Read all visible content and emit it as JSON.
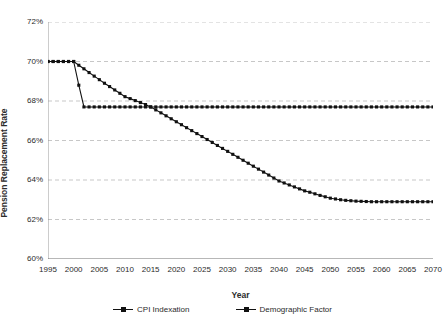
{
  "chart_data": {
    "type": "line",
    "title": "",
    "xlabel": "Year",
    "ylabel": "Pension Replacement Rate",
    "xlim": [
      1995,
      2070
    ],
    "ylim": [
      60,
      72
    ],
    "ytick_step": 2,
    "xtick_step": 5,
    "grid": true,
    "grid_style": "dashed-horizontal",
    "legend_position": "bottom",
    "ytick_labels": [
      "60%",
      "62%",
      "64%",
      "66%",
      "68%",
      "70%",
      "72%"
    ],
    "ytick_values": [
      60,
      62,
      64,
      66,
      68,
      70,
      72
    ],
    "xtick_labels": [
      "1995",
      "2000",
      "2005",
      "2010",
      "2015",
      "2020",
      "2025",
      "2030",
      "2035",
      "2040",
      "2045",
      "2050",
      "2055",
      "2060",
      "2065",
      "2070"
    ],
    "xtick_values": [
      1995,
      2000,
      2005,
      2010,
      2015,
      2020,
      2025,
      2030,
      2035,
      2040,
      2045,
      2050,
      2055,
      2060,
      2065,
      2070
    ],
    "x": [
      1995,
      1996,
      1997,
      1998,
      1999,
      2000,
      2001,
      2002,
      2003,
      2004,
      2005,
      2006,
      2007,
      2008,
      2009,
      2010,
      2011,
      2012,
      2013,
      2014,
      2015,
      2016,
      2017,
      2018,
      2019,
      2020,
      2021,
      2022,
      2023,
      2024,
      2025,
      2026,
      2027,
      2028,
      2029,
      2030,
      2031,
      2032,
      2033,
      2034,
      2035,
      2036,
      2037,
      2038,
      2039,
      2040,
      2041,
      2042,
      2043,
      2044,
      2045,
      2046,
      2047,
      2048,
      2049,
      2050,
      2051,
      2052,
      2053,
      2054,
      2055,
      2056,
      2057,
      2058,
      2059,
      2060,
      2061,
      2062,
      2063,
      2064,
      2065,
      2066,
      2067,
      2068,
      2069,
      2070
    ],
    "series": [
      {
        "name": "CPI Indexation",
        "color": "#111111",
        "marker": "square",
        "values": [
          70.0,
          70.0,
          70.0,
          70.0,
          70.0,
          70.0,
          68.8,
          67.7,
          67.7,
          67.7,
          67.7,
          67.7,
          67.7,
          67.7,
          67.7,
          67.7,
          67.7,
          67.7,
          67.7,
          67.7,
          67.7,
          67.7,
          67.7,
          67.7,
          67.7,
          67.7,
          67.7,
          67.7,
          67.7,
          67.7,
          67.7,
          67.7,
          67.7,
          67.7,
          67.7,
          67.7,
          67.7,
          67.7,
          67.7,
          67.7,
          67.7,
          67.7,
          67.7,
          67.7,
          67.7,
          67.7,
          67.7,
          67.7,
          67.7,
          67.7,
          67.7,
          67.7,
          67.7,
          67.7,
          67.7,
          67.7,
          67.7,
          67.7,
          67.7,
          67.7,
          67.7,
          67.7,
          67.7,
          67.7,
          67.7,
          67.7,
          67.7,
          67.7,
          67.7,
          67.7,
          67.7,
          67.7,
          67.7,
          67.7,
          67.7,
          67.7
        ]
      },
      {
        "name": "Demographic Factor",
        "color": "#111111",
        "marker": "square",
        "values": [
          70.0,
          70.0,
          70.0,
          70.0,
          70.0,
          70.0,
          69.81,
          69.63,
          69.44,
          69.26,
          69.08,
          68.9,
          68.73,
          68.56,
          68.39,
          68.22,
          68.12,
          68.02,
          67.92,
          67.82,
          67.7,
          67.55,
          67.4,
          67.25,
          67.1,
          66.95,
          66.8,
          66.65,
          66.5,
          66.35,
          66.2,
          66.05,
          65.9,
          65.75,
          65.6,
          65.45,
          65.3,
          65.15,
          65.0,
          64.85,
          64.7,
          64.55,
          64.4,
          64.25,
          64.1,
          63.95,
          63.85,
          63.75,
          63.65,
          63.55,
          63.45,
          63.38,
          63.3,
          63.22,
          63.15,
          63.08,
          63.04,
          63.0,
          62.97,
          62.95,
          62.93,
          62.92,
          62.91,
          62.9,
          62.9,
          62.9,
          62.9,
          62.9,
          62.9,
          62.9,
          62.9,
          62.9,
          62.9,
          62.9,
          62.9,
          62.9
        ]
      }
    ]
  },
  "axes": {
    "y_title": "Pension Replacement Rate",
    "x_title": "Year"
  },
  "legend": {
    "items": [
      {
        "label": "CPI Indexation"
      },
      {
        "label": "Demographic Factor"
      }
    ]
  }
}
